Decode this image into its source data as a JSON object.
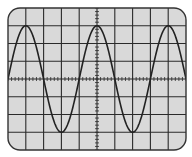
{
  "display": {
    "title": "Oscilloscope trace",
    "frame": {
      "x": 8,
      "y": 8,
      "width": 178,
      "height": 142,
      "corner_radius": 12
    },
    "grid": {
      "h_divisions": 10,
      "v_divisions": 8,
      "minor_ticks_per_division": 5
    },
    "colors": {
      "screen": "#d9d9d9",
      "grid": "#2a2a2a",
      "trace": "#222222",
      "frame": "#333333",
      "background": "#ffffff"
    }
  },
  "waveform": {
    "type": "sine",
    "amplitude_divisions": 3,
    "period_divisions": 4,
    "cycles_visible": 2.5,
    "peaks_at_division_x": [
      1,
      5,
      9
    ],
    "troughs_at_division_x": [
      3,
      7
    ]
  }
}
